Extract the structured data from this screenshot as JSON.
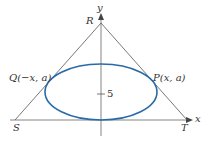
{
  "diagram": {
    "axes": {
      "x_label": "x",
      "y_label": "y"
    },
    "vertices": {
      "R": "R",
      "S": "S",
      "T": "T"
    },
    "points": {
      "Q": "Q(−x, a)",
      "P": "P(x, a)"
    },
    "tick": {
      "label": "5",
      "value": 5
    },
    "colors": {
      "ellipse": "#2a6aa8",
      "lines": "#555555",
      "text": "#333333"
    }
  }
}
